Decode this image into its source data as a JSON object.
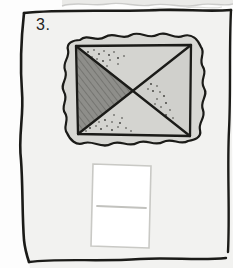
{
  "worksheet": {
    "question_number": "3.",
    "page_background_color": "#f2f2f0",
    "page_border_color": "#1b1b18",
    "torn_edge_color": "#cfcfcf"
  },
  "figure": {
    "name": "sandwich-bread-slice",
    "bread_fill_color": "#d8d8d4",
    "bread_outline_color": "#1b1b18",
    "rectangle_outline_color": "#1b1b18",
    "regions": [
      {
        "id": "top-triangle",
        "label": "top triangle",
        "fill_color": "#d4d4d0",
        "pattern": "dots"
      },
      {
        "id": "left-triangle",
        "label": "left triangle",
        "fill_color": "#8e8e8a",
        "pattern": "diagonal-hatch"
      },
      {
        "id": "bottom-triangle",
        "label": "bottom triangle",
        "fill_color": "#d4d4d0",
        "pattern": "dots"
      },
      {
        "id": "right-triangle",
        "label": "right triangle",
        "fill_color": "#d0d0cc",
        "pattern": "dots"
      }
    ],
    "division_lines": 2,
    "parts": 4
  },
  "answer_box": {
    "value": "",
    "placeholder": "",
    "fill_color": "#ffffff",
    "border_color": "#c9c9c5",
    "rule_line_color": "#c2c2be"
  }
}
